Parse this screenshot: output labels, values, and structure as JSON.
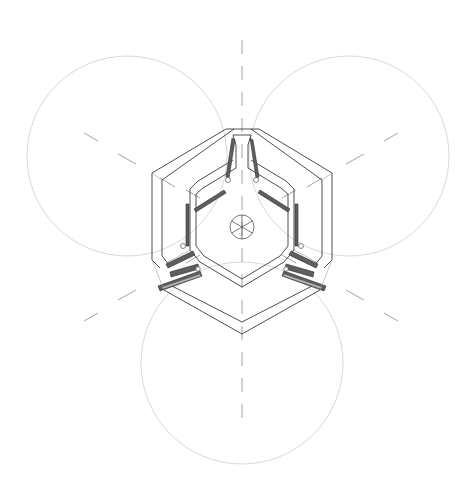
{
  "diagram": {
    "type": "architectural-plan",
    "colors": {
      "background": "#ffffff",
      "wall_line": "#3a3a3a",
      "swing_circle": "#d4d4d4",
      "center_axis": "#8a8a8a",
      "panel_fill": "#5e5e5e"
    },
    "swing_circles": [
      {
        "id": "left",
        "cx": 127,
        "cy": 156,
        "r": 100
      },
      {
        "id": "right",
        "cx": 349,
        "cy": 156,
        "r": 100
      },
      {
        "id": "bottom",
        "cx": 242,
        "cy": 363,
        "r": 101
      }
    ],
    "center": {
      "x": 242,
      "y": 227,
      "hub_radius": 12
    },
    "labels": []
  }
}
